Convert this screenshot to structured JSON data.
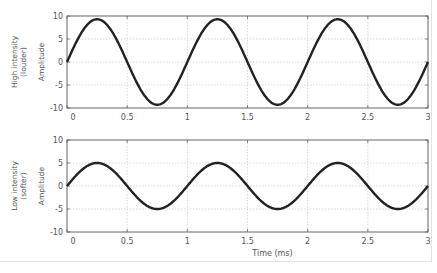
{
  "chart_data": [
    {
      "type": "line",
      "panel_label": [
        "High intensity",
        "(louder)"
      ],
      "ylabel": "Amplitude",
      "xlabel": "",
      "xlim": [
        0,
        3
      ],
      "ylim": [
        -10,
        10
      ],
      "xticks": [
        0,
        0.5,
        1,
        1.5,
        2,
        2.5,
        3
      ],
      "xtick_labels": [
        "0",
        "0.5",
        "1",
        "1.5",
        "2",
        "2.5",
        "3"
      ],
      "yticks": [
        10,
        5,
        0,
        -5,
        -10
      ],
      "ytick_labels": [
        "10",
        "5",
        "0",
        "-5",
        "-10"
      ],
      "grid": true,
      "series": [
        {
          "name": "High intensity wave",
          "function": "sine",
          "amplitude": 9.3,
          "frequency_khz": 1,
          "phase": 0,
          "color": "#222222"
        }
      ]
    },
    {
      "type": "line",
      "panel_label": [
        "Low intensity",
        "(softer)"
      ],
      "ylabel": "Amplitude",
      "xlabel": "Time (ms)",
      "xlim": [
        0,
        3
      ],
      "ylim": [
        -10,
        10
      ],
      "xticks": [
        0,
        0.5,
        1,
        1.5,
        2,
        2.5,
        3
      ],
      "xtick_labels": [
        "0",
        "0.5",
        "1",
        "1.5",
        "2",
        "2.5",
        "3"
      ],
      "yticks": [
        10,
        5,
        0,
        -5,
        -10
      ],
      "ytick_labels": [
        "10",
        "5",
        "0",
        "-5",
        "-10"
      ],
      "grid": true,
      "series": [
        {
          "name": "Low intensity wave",
          "function": "sine",
          "amplitude": 5,
          "frequency_khz": 1,
          "phase": 0,
          "color": "#222222"
        }
      ]
    }
  ],
  "colors": {
    "axis": "#666666",
    "grid": "#c8c8c8",
    "text": "#555555",
    "line": "#222222"
  }
}
